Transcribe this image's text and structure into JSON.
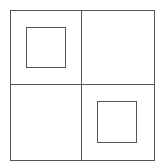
{
  "diagram": {
    "stroke_color": "#555555",
    "background_color": "#ffffff",
    "outer_frame": {
      "x": 10,
      "y": 10,
      "width": 145,
      "height": 151
    },
    "divider_vertical": {
      "x": 81,
      "y": 10,
      "height": 151
    },
    "divider_horizontal": {
      "x": 10,
      "y": 84,
      "width": 145
    },
    "cells": [
      {
        "position": "top-left",
        "has_square": true,
        "square": {
          "x": 26,
          "y": 27,
          "width": 40,
          "height": 41
        }
      },
      {
        "position": "top-right",
        "has_square": false
      },
      {
        "position": "bottom-left",
        "has_square": false
      },
      {
        "position": "bottom-right",
        "has_square": true,
        "square": {
          "x": 97,
          "y": 101,
          "width": 40,
          "height": 42
        }
      }
    ]
  }
}
